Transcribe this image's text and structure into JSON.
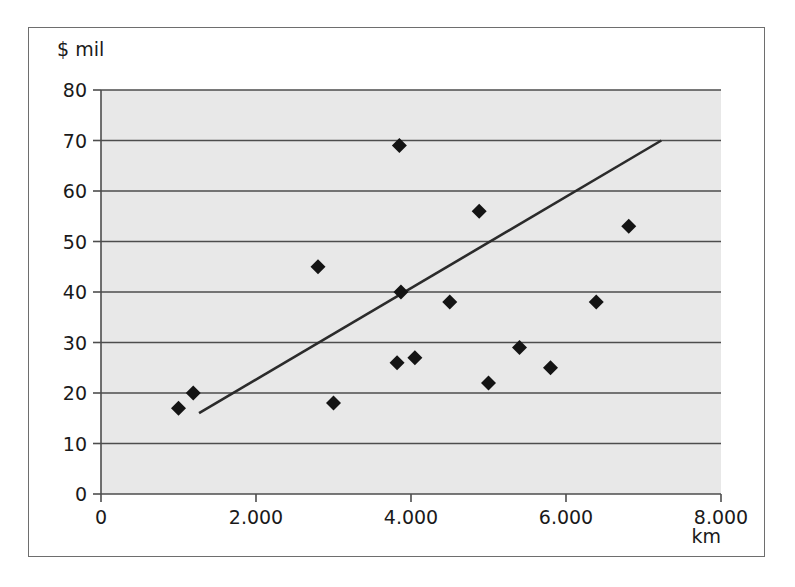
{
  "chart_data": {
    "type": "scatter",
    "title": "",
    "xlabel": "km",
    "ylabel": "$ mil",
    "xlim": [
      0,
      8000
    ],
    "ylim": [
      0,
      80
    ],
    "grid": "horizontal",
    "legend": "none",
    "x_ticks": [
      "0",
      "2.000",
      "4.000",
      "6.000",
      "8.000"
    ],
    "x_tick_values": [
      0,
      2000,
      4000,
      6000,
      8000
    ],
    "y_ticks": [
      "0",
      "10",
      "20",
      "30",
      "40",
      "50",
      "60",
      "70",
      "80"
    ],
    "y_tick_values": [
      0,
      10,
      20,
      30,
      40,
      50,
      60,
      70,
      80
    ],
    "marker": "diamond",
    "marker_color": "#141414",
    "points": [
      {
        "x": 1000,
        "y": 17
      },
      {
        "x": 1190,
        "y": 20
      },
      {
        "x": 2800,
        "y": 45
      },
      {
        "x": 3000,
        "y": 18
      },
      {
        "x": 3820,
        "y": 26
      },
      {
        "x": 3850,
        "y": 69
      },
      {
        "x": 3870,
        "y": 40
      },
      {
        "x": 4050,
        "y": 27
      },
      {
        "x": 4500,
        "y": 38
      },
      {
        "x": 4880,
        "y": 56
      },
      {
        "x": 5000,
        "y": 22
      },
      {
        "x": 5400,
        "y": 29
      },
      {
        "x": 5800,
        "y": 25
      },
      {
        "x": 6390,
        "y": 38
      },
      {
        "x": 6810,
        "y": 53
      }
    ],
    "trendline": {
      "type": "linear",
      "x_start": 1265,
      "y_start": 16,
      "x_end": 7230,
      "y_end": 70,
      "color": "#2b2b2b"
    },
    "plot_background": "#e8e8e8",
    "gridline_color": "#4d4d4d",
    "axis_color": "#4d4d4d"
  }
}
